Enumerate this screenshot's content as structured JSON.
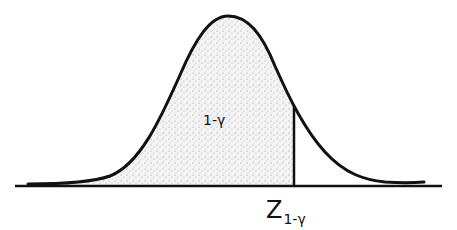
{
  "diagram": {
    "type": "normal-distribution-curve",
    "shaded_region": {
      "from": "left-tail",
      "to": "critical-value",
      "label": "1-γ"
    },
    "critical_value": {
      "symbol": "Z",
      "subscript": "1-γ"
    },
    "colors": {
      "line": "#111111",
      "shade": "#bdbdbd",
      "background": "#ffffff"
    }
  },
  "labels": {
    "area": "1-γ",
    "z_symbol": "Z",
    "z_subscript": "1-γ"
  }
}
